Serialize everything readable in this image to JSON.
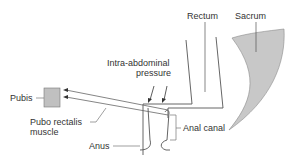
{
  "diagram": {
    "type": "anatomical-schematic",
    "labels": {
      "rectum": "Rectum",
      "sacrum": "Sacrum",
      "pressure_line1": "Intra-abdominal",
      "pressure_line2": "pressure",
      "pubis": "Pubis",
      "muscle_line1": "Pubo rectalis",
      "muscle_line2": "muscle",
      "anal_canal": "Anal canal",
      "anus": "Anus"
    },
    "colors": {
      "line": "#555555",
      "bone_fill": "#c8c8c8",
      "text": "#333333"
    }
  }
}
